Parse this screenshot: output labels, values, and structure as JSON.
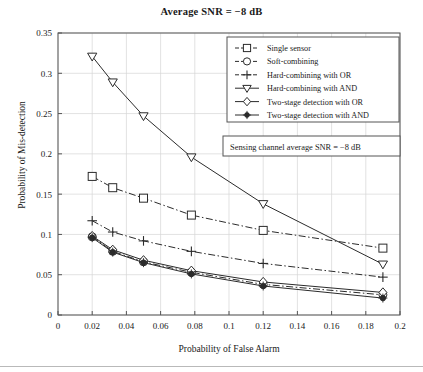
{
  "chart_data": {
    "type": "line",
    "title": "Average SNR = −8 dB",
    "xlabel": "Probability of False Alarm",
    "ylabel": "Probability of Mis-detection",
    "xlim": [
      0,
      0.2
    ],
    "ylim": [
      0,
      0.35
    ],
    "xticks": [
      "0",
      "0.02",
      "0.04",
      "0.06",
      "0.08",
      "0.1",
      "0.12",
      "0.14",
      "0.16",
      "0.18",
      "0.2"
    ],
    "xtick_values": [
      0,
      0.02,
      0.04,
      0.06,
      0.08,
      0.1,
      0.12,
      0.14,
      0.16,
      0.18,
      0.2
    ],
    "yticks": [
      "0",
      "0.05",
      "0.1",
      "0.15",
      "0.2",
      "0.25",
      "0.3",
      "0.35"
    ],
    "ytick_values": [
      0,
      0.05,
      0.1,
      0.15,
      0.2,
      0.25,
      0.3,
      0.35
    ],
    "grid": true,
    "legend_position": "top-right",
    "x": [
      0.02,
      0.032,
      0.05,
      0.078,
      0.12,
      0.19
    ],
    "series": [
      {
        "name": "Single sensor",
        "marker": "square",
        "linestyle": "dash-dot",
        "values": [
          0.172,
          0.158,
          0.145,
          0.124,
          0.105,
          0.083
        ]
      },
      {
        "name": "Soft-combining",
        "marker": "circle",
        "linestyle": "dash-dot",
        "values": [
          0.097,
          0.079,
          0.066,
          0.053,
          0.038,
          0.025
        ]
      },
      {
        "name": "Hard-combining with OR",
        "marker": "plus",
        "linestyle": "dash-dot",
        "values": [
          0.117,
          0.103,
          0.092,
          0.079,
          0.064,
          0.047
        ]
      },
      {
        "name": "Hard-combining with AND",
        "marker": "triangle-down",
        "linestyle": "solid",
        "values": [
          0.321,
          0.289,
          0.247,
          0.196,
          0.138,
          0.063
        ]
      },
      {
        "name": "Two-stage detection with OR",
        "marker": "diamond",
        "linestyle": "solid",
        "values": [
          0.098,
          0.081,
          0.068,
          0.055,
          0.041,
          0.028
        ]
      },
      {
        "name": "Two-stage detection with AND",
        "marker": "star",
        "linestyle": "solid",
        "values": [
          0.096,
          0.078,
          0.065,
          0.051,
          0.036,
          0.021
        ]
      }
    ],
    "annotation": "Sensing channel average SNR = −8 dB",
    "colors": {
      "line": "#2b2b2b",
      "grid": "#d6d6d6",
      "axis": "#555555",
      "background": "#ffffff"
    }
  }
}
